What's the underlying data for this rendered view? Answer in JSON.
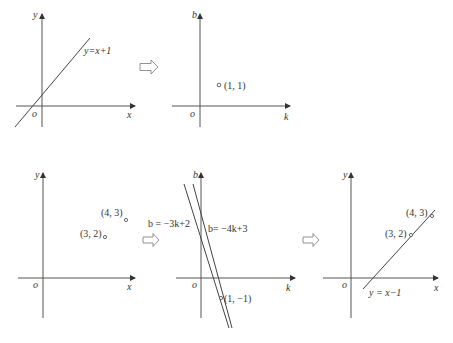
{
  "panels": [
    {
      "id": "panel-1",
      "axes": {
        "x": "x",
        "y": "y",
        "origin": "o"
      },
      "lines": [
        {
          "label": "y=x+1"
        }
      ]
    },
    {
      "id": "panel-2",
      "axes": {
        "x": "k",
        "y": "b",
        "origin": "o"
      },
      "points": [
        {
          "label": "(1, 1)"
        }
      ]
    },
    {
      "id": "panel-3",
      "axes": {
        "x": "x",
        "y": "y",
        "origin": "o"
      },
      "points": [
        {
          "label": "(4, 3)"
        },
        {
          "label": "(3, 2)"
        }
      ]
    },
    {
      "id": "panel-4",
      "axes": {
        "x": "k",
        "y": "b",
        "origin": "o"
      },
      "lines": [
        {
          "label": "b = −3k+2"
        },
        {
          "label": "b= −4k+3"
        }
      ],
      "points": [
        {
          "label": "(1, −1)"
        }
      ]
    },
    {
      "id": "panel-5",
      "axes": {
        "x": "x",
        "y": "y",
        "origin": "o"
      },
      "lines": [
        {
          "label": "y = x−1"
        }
      ],
      "points": [
        {
          "label": "(4, 3)"
        },
        {
          "label": "(3, 2)"
        }
      ]
    }
  ],
  "arrows": [
    "implies-arrow",
    "implies-arrow",
    "implies-arrow"
  ]
}
